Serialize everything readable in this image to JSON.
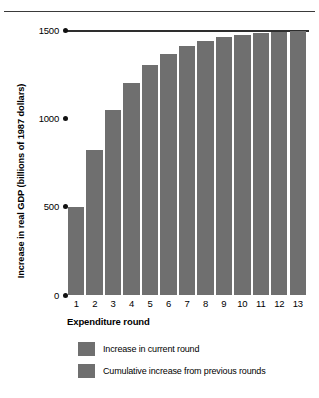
{
  "chart_data": {
    "type": "bar",
    "title": "",
    "xlabel": "Expenditure round",
    "ylabel": "Increase in real GDP (billions of 1987 dollars)",
    "categories": [
      "1",
      "2",
      "3",
      "4",
      "5",
      "6",
      "7",
      "8",
      "9",
      "10",
      "11",
      "12",
      "13"
    ],
    "values": [
      500,
      820,
      1050,
      1200,
      1300,
      1365,
      1410,
      1440,
      1460,
      1472,
      1482,
      1488,
      1495
    ],
    "ylim": [
      0,
      1500
    ],
    "yticks": [
      0,
      500,
      1000,
      1500
    ],
    "ytick_labels": [
      "0",
      "500",
      "1000",
      "1500"
    ],
    "grid": false,
    "reference_line": 1500,
    "legend_position": "bottom",
    "legend": [
      {
        "label": "Increase in current round",
        "color": "#6f6f6f"
      },
      {
        "label": "Cumulative increase from previous rounds",
        "color": "#6f6f6f"
      }
    ],
    "bar_color": "#6f6f6f",
    "annotations": []
  },
  "axis": {
    "y_title": "Increase in real GDP (billions of 1987 dollars)",
    "x_title": "Expenditure round"
  },
  "colors": {
    "bar": "#6f6f6f",
    "rule": "#3a3a3a",
    "text": "#000000"
  }
}
